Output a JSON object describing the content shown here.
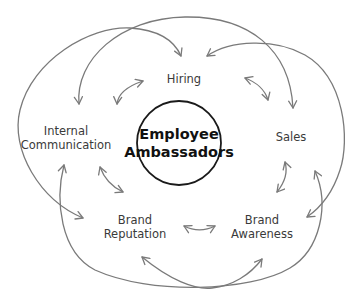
{
  "diagram": {
    "title": "Employee Ambassadors",
    "center": {
      "line1": "Employee",
      "line2": "Ambassadors"
    },
    "nodes": [
      {
        "id": "hiring",
        "lines": [
          "Hiring"
        ]
      },
      {
        "id": "internal-communication",
        "lines": [
          "Internal",
          "Communication"
        ]
      },
      {
        "id": "sales",
        "lines": [
          "Sales"
        ]
      },
      {
        "id": "brand-reputation",
        "lines": [
          "Brand",
          "Reputation"
        ]
      },
      {
        "id": "brand-awareness",
        "lines": [
          "Brand",
          "Awareness"
        ]
      }
    ],
    "connections": [
      {
        "from": "brand-reputation",
        "to": "hiring",
        "style": "outer-arc"
      },
      {
        "from": "internal-communication",
        "to": "sales",
        "style": "outer-arc"
      },
      {
        "from": "hiring",
        "to": "brand-awareness",
        "style": "outer-arc"
      },
      {
        "from": "sales",
        "to": "internal-communication",
        "style": "outer-arc"
      },
      {
        "from": "brand-reputation",
        "to": "brand-awareness",
        "style": "outer-arc"
      },
      {
        "from": "internal-communication",
        "to": "hiring",
        "style": "short-double-arrow"
      },
      {
        "from": "hiring",
        "to": "sales",
        "style": "short-double-arrow"
      },
      {
        "from": "sales",
        "to": "brand-awareness",
        "style": "short-double-arrow"
      },
      {
        "from": "brand-awareness",
        "to": "brand-reputation",
        "style": "short-double-arrow"
      },
      {
        "from": "brand-reputation",
        "to": "internal-communication",
        "style": "short-double-arrow"
      }
    ],
    "colors": {
      "background": "#ffffff",
      "arrow": "#7a7a7a",
      "center_circle_stroke": "#1a1a1a",
      "label_text": "#3a3a3a",
      "center_text": "#111111"
    }
  }
}
